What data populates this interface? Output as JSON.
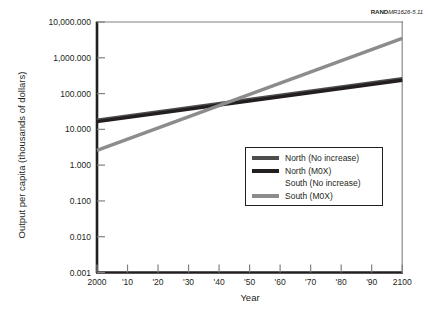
{
  "figure": {
    "source_tag_prefix": "RAND",
    "source_tag_number": "MR1626-5.11"
  },
  "chart_data": {
    "type": "line",
    "title": "",
    "xlabel": "Year",
    "ylabel": "Output per capita (thousands of dollars)",
    "x_tick_labels": [
      "2000",
      "'10",
      "'20",
      "'30",
      "'40",
      "'50",
      "'60",
      "'70",
      "'80",
      "'90",
      "2100"
    ],
    "x_tick_values": [
      2000,
      2010,
      2020,
      2030,
      2040,
      2050,
      2060,
      2070,
      2080,
      2090,
      2100
    ],
    "xlim": [
      2000,
      2100
    ],
    "y_scale": "log",
    "y_tick_labels": [
      "10,000.000",
      "1,000.000",
      "100.000",
      "10.000",
      "1.000",
      "0.100",
      "0.010",
      "0.001"
    ],
    "y_tick_values": [
      10000,
      1000,
      100,
      10,
      1,
      0.1,
      0.01,
      0.001
    ],
    "ylim": [
      0.001,
      10000
    ],
    "y_units_note": "thousands of dollars",
    "grid": false,
    "legend_position": "center-right",
    "series": [
      {
        "name": "North (No increase)",
        "color": "#4d4d4d",
        "x": [
          2000,
          2100
        ],
        "values": [
          18.0,
          260.0
        ],
        "visible": true
      },
      {
        "name": "North (M0X)",
        "color": "#231f20",
        "x": [
          2000,
          2100
        ],
        "values": [
          16.5,
          235.0
        ],
        "visible": true
      },
      {
        "name": "South (No increase)",
        "color": "#ffffff",
        "x": [
          2000,
          2100
        ],
        "values": [
          null,
          null
        ],
        "visible": false
      },
      {
        "name": "South (M0X)",
        "color": "#8c8c8c",
        "x": [
          2000,
          2100
        ],
        "values": [
          2.6,
          3500.0
        ],
        "visible": true
      }
    ],
    "annotations": [
      {
        "text": "Lines cross near year 2045 at about 50,000 thousands of dollars"
      }
    ]
  },
  "legend": {
    "items": [
      {
        "label": "North (No increase)",
        "color": "#4d4d4d",
        "swatch_visible": true
      },
      {
        "label": "North (M0X)",
        "color": "#231f20",
        "swatch_visible": true
      },
      {
        "label": "South (No increase)",
        "color": "#ffffff",
        "swatch_visible": false
      },
      {
        "label": "South (M0X)",
        "color": "#8c8c8c",
        "swatch_visible": true
      }
    ]
  }
}
